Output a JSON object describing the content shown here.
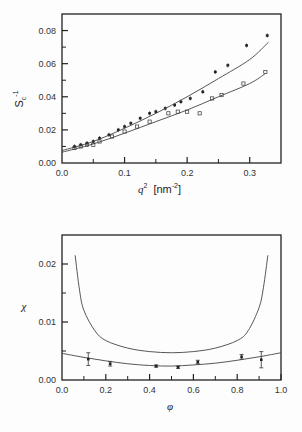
{
  "chart_data": [
    {
      "type": "scatter",
      "title": "",
      "xlabel": "q^2 [nm^-2]",
      "ylabel": "S_c^-1",
      "xlim": [
        0.0,
        0.35
      ],
      "ylim": [
        0.0,
        0.09
      ],
      "xticks": [
        "0.0",
        "0.1",
        "0.2",
        "0.3"
      ],
      "yticks": [
        "0.00",
        "0.02",
        "0.04",
        "0.06",
        "0.08"
      ],
      "grid": false,
      "legend": null,
      "series": [
        {
          "name": "upper (filled markers)",
          "marker": "filled",
          "x": [
            0.02,
            0.03,
            0.04,
            0.05,
            0.06,
            0.075,
            0.09,
            0.1,
            0.11,
            0.125,
            0.14,
            0.15,
            0.165,
            0.18,
            0.19,
            0.205,
            0.225,
            0.245,
            0.265,
            0.295,
            0.328
          ],
          "y": [
            0.01,
            0.011,
            0.012,
            0.013,
            0.015,
            0.017,
            0.02,
            0.022,
            0.024,
            0.027,
            0.03,
            0.031,
            0.033,
            0.035,
            0.037,
            0.039,
            0.043,
            0.055,
            0.059,
            0.071,
            0.077
          ]
        },
        {
          "name": "lower (open markers)",
          "marker": "open",
          "x": [
            0.02,
            0.03,
            0.04,
            0.05,
            0.06,
            0.08,
            0.1,
            0.12,
            0.14,
            0.17,
            0.185,
            0.2,
            0.22,
            0.24,
            0.255,
            0.29,
            0.325
          ],
          "y": [
            0.009,
            0.01,
            0.011,
            0.011,
            0.013,
            0.016,
            0.019,
            0.022,
            0.025,
            0.03,
            0.031,
            0.031,
            0.03,
            0.039,
            0.041,
            0.048,
            0.055
          ]
        },
        {
          "name": "fit upper",
          "type": "line",
          "x": [
            0.0,
            0.05,
            0.1,
            0.15,
            0.2,
            0.25,
            0.3,
            0.33
          ],
          "y": [
            0.0075,
            0.013,
            0.021,
            0.03,
            0.04,
            0.051,
            0.0625,
            0.073
          ]
        },
        {
          "name": "fit lower",
          "type": "line",
          "x": [
            0.0,
            0.05,
            0.1,
            0.15,
            0.2,
            0.25,
            0.3,
            0.325
          ],
          "y": [
            0.0065,
            0.0115,
            0.018,
            0.025,
            0.032,
            0.04,
            0.048,
            0.054
          ]
        }
      ]
    },
    {
      "type": "line",
      "title": "",
      "xlabel": "phi",
      "ylabel": "chi",
      "xlim": [
        0.0,
        1.0
      ],
      "ylim": [
        0.0,
        0.025
      ],
      "xticks": [
        "0.0",
        "0.2",
        "0.4",
        "0.6",
        "0.8",
        "1.0"
      ],
      "yticks": [
        "0.00",
        "0.01",
        "0.02"
      ],
      "grid": false,
      "legend": null,
      "series": [
        {
          "name": "spinodal curve (upper)",
          "type": "line",
          "x": [
            0.06,
            0.08,
            0.1,
            0.15,
            0.2,
            0.3,
            0.4,
            0.5,
            0.6,
            0.7,
            0.8,
            0.85,
            0.9,
            0.92,
            0.94
          ],
          "y": [
            0.0215,
            0.0155,
            0.012,
            0.0085,
            0.0068,
            0.0055,
            0.0049,
            0.0047,
            0.0049,
            0.0055,
            0.0068,
            0.0085,
            0.0125,
            0.016,
            0.0215
          ]
        },
        {
          "name": "fit curve (lower)",
          "type": "line",
          "x": [
            0.0,
            0.1,
            0.2,
            0.3,
            0.4,
            0.5,
            0.6,
            0.7,
            0.8,
            0.9,
            1.0
          ],
          "y": [
            0.0046,
            0.0039,
            0.0033,
            0.0028,
            0.0025,
            0.0024,
            0.0026,
            0.0029,
            0.0034,
            0.004,
            0.0047
          ]
        },
        {
          "name": "measured chi",
          "type": "scatter",
          "x": [
            0.12,
            0.22,
            0.43,
            0.53,
            0.62,
            0.82,
            0.91
          ],
          "y": [
            0.0036,
            0.0028,
            0.0024,
            0.0022,
            0.0031,
            0.004,
            0.0035
          ],
          "yerr": [
            0.0011,
            0.0004,
            0.0002,
            0.0002,
            0.0003,
            0.0004,
            0.0014
          ]
        }
      ]
    }
  ],
  "labels": {
    "top_ylabel_main": "S",
    "top_ylabel_sub": "c",
    "top_ylabel_sup": "-1",
    "top_xlabel_var": "q",
    "top_xlabel_sup": "2",
    "top_xlabel_unit": "[nm",
    "top_xlabel_unit_sup": "-2",
    "top_xlabel_unit_close": "]",
    "bottom_ylabel": "χ",
    "bottom_xlabel": "φ"
  }
}
